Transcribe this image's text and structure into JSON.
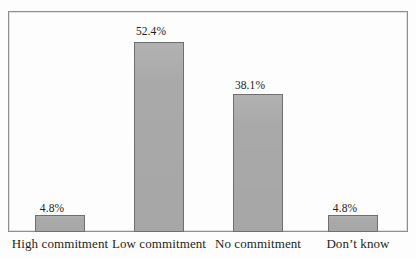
{
  "chart_data": {
    "type": "bar",
    "title": "",
    "subtitle": "",
    "xlabel": "",
    "ylabel": "",
    "categories": [
      "High commitment",
      "Low commitment",
      "No commitment",
      "Don’t know"
    ],
    "values": [
      4.8,
      52.4,
      38.1,
      4.8
    ],
    "data_labels": [
      "4.8%",
      "52.4%",
      "38.1%",
      "4.8%"
    ],
    "ylim": [
      0,
      60
    ],
    "grid": false,
    "legend": null,
    "series": [
      {
        "name": "Percentage of respondents",
        "values": [
          4.8,
          52.4,
          38.1,
          4.8
        ]
      }
    ],
    "colors": {
      "bar_fill": "#a9a9a9",
      "bar_border": "#6f6f6f",
      "frame_border": "#8f8f8f",
      "background": "#fdfdfd",
      "label_text": "#1d1d1d"
    }
  }
}
